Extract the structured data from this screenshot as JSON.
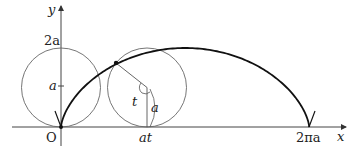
{
  "diagram": {
    "axes": {
      "x_label": "x",
      "y_label": "y",
      "origin_label": "O"
    },
    "y_ticks": [
      {
        "label": "2a"
      },
      {
        "label": "a"
      }
    ],
    "x_ticks": [
      {
        "label": "at"
      },
      {
        "label": "2πa"
      }
    ],
    "annotations": {
      "angle_label": "t",
      "radius_label": "a"
    },
    "colors": {
      "curve": "#111111",
      "circle": "#555555",
      "axis": "#333333"
    }
  }
}
